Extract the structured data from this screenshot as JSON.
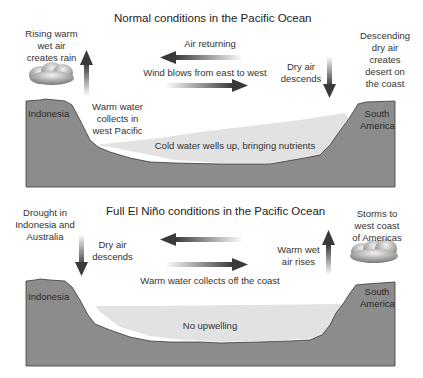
{
  "panels": [
    {
      "title": "Normal conditions in the Pacific Ocean",
      "labels": {
        "rising_air": [
          "Rising warm",
          "wet air",
          "creates rain"
        ],
        "air_returning": "Air returning",
        "wind": "Wind blows from east to west",
        "dry_air": [
          "Dry air",
          "descends"
        ],
        "desert": [
          "Descending",
          "dry air",
          "creates",
          "desert on",
          "the coast"
        ],
        "warm_water": [
          "Warm water",
          "collects in",
          "west Pacific"
        ],
        "cold_water": "Cold water wells up, bringing nutrients",
        "west_land": "Indonesia",
        "east_land": [
          "South",
          "America"
        ]
      }
    },
    {
      "title": "Full El Niño conditions in the Pacific Ocean",
      "labels": {
        "drought": [
          "Drought in",
          "Indonesia and",
          "Australia"
        ],
        "dry_air": [
          "Dry air",
          "descends"
        ],
        "warm_water": "Warm water collects off the coast",
        "warm_air": [
          "Warm wet",
          "air rises"
        ],
        "storms": [
          "Storms to",
          "west coast",
          "of Americas"
        ],
        "upwelling": "No upwelling",
        "west_land": "Indonesia",
        "east_land": [
          "South",
          "America"
        ]
      }
    }
  ],
  "colors": {
    "land": "#8c8c8c",
    "water": "#e2e2e2",
    "arrow": "#444444",
    "outline": "#3a3a3a"
  }
}
